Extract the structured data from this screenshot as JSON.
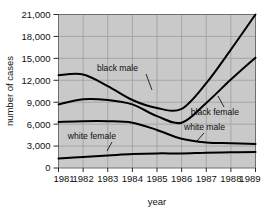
{
  "chart_data": {
    "type": "line",
    "title": "",
    "xlabel": "year",
    "ylabel": "number of cases",
    "categories": [
      1981,
      1982,
      1983,
      1984,
      1985,
      1986,
      1987,
      1988,
      1989
    ],
    "x": [
      1981,
      1982,
      1983,
      1984,
      1985,
      1986,
      1987,
      1988,
      1989
    ],
    "xlim": [
      1981,
      1989
    ],
    "ylim": [
      0,
      21000
    ],
    "yticks": [
      0,
      3000,
      6000,
      9000,
      12000,
      15000,
      18000,
      21000
    ],
    "ytick_labels": [
      "0",
      "3,000",
      "6,000",
      "9,000",
      "12,000",
      "15,000",
      "18,000",
      "21,000"
    ],
    "xtick_labels": [
      "1981",
      "1982",
      "1983",
      "1984",
      "1985",
      "1986",
      "1987",
      "1988",
      "1989"
    ],
    "grid": true,
    "legend_position": "inline-annotations",
    "series": [
      {
        "name": "black male",
        "values": [
          12700,
          12800,
          11200,
          9300,
          8200,
          8100,
          11600,
          16200,
          21000
        ]
      },
      {
        "name": "black female",
        "values": [
          8700,
          9400,
          9300,
          8700,
          7100,
          6200,
          8900,
          12100,
          15100
        ]
      },
      {
        "name": "white male",
        "values": [
          6300,
          6400,
          6400,
          6200,
          5200,
          4000,
          3500,
          3400,
          3300
        ]
      },
      {
        "name": "white female",
        "values": [
          1300,
          1500,
          1700,
          1900,
          2000,
          2000,
          2100,
          2150,
          2200
        ]
      }
    ],
    "annotations": [
      {
        "text": "black male",
        "x": 138,
        "y": 71
      },
      {
        "text": "black female",
        "x": 239,
        "y": 115
      },
      {
        "text": "white male",
        "x": 225,
        "y": 130
      },
      {
        "text": "white female",
        "x": 116,
        "y": 139
      }
    ]
  },
  "colors": {
    "plot_background": "#c9c9c9",
    "line": "#000000",
    "frame": "#6f6f6f",
    "grid": "#9d9d9d",
    "page_background": "#ffffff",
    "text": "#111111"
  }
}
